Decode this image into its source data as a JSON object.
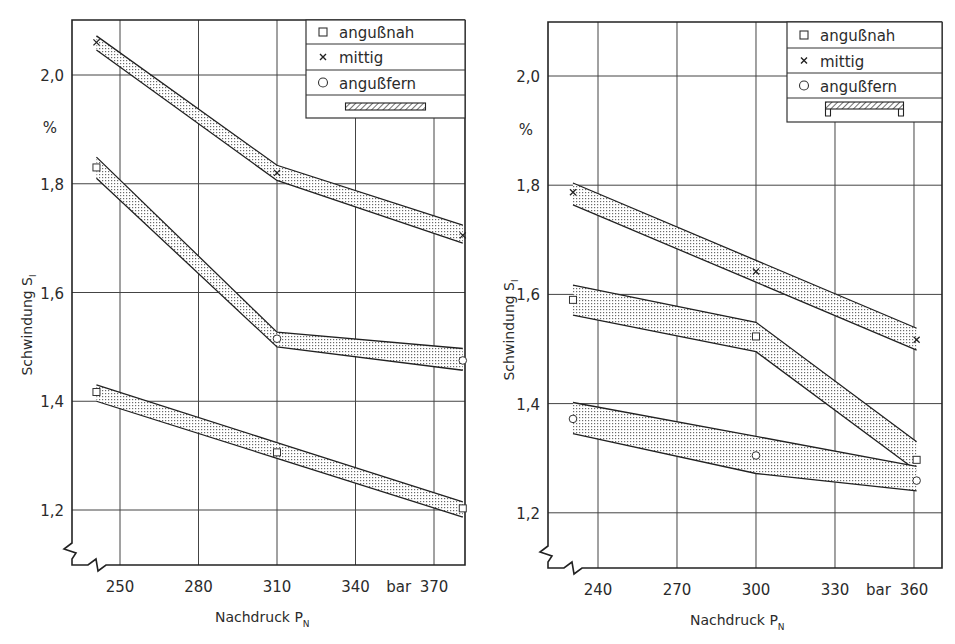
{
  "chart_data": [
    {
      "type": "line",
      "title": "",
      "xlabel": "Nachdruck P_N",
      "xlabel_main": "Nachdruck P",
      "xlabel_sub": "N",
      "ylabel": "Schwindung S_l",
      "ylabel_main": "Schwindung S",
      "ylabel_sub": "l",
      "y_unit": "%",
      "x_unit": "bar",
      "xlim": [
        241,
        381
      ],
      "ylim": [
        1.15,
        2.1
      ],
      "x_ticks": [
        250,
        280,
        310,
        340,
        370
      ],
      "x_tick_labels": [
        "250",
        "280",
        "310",
        "340",
        "370"
      ],
      "y_ticks": [
        1.2,
        1.4,
        1.6,
        1.8,
        2.0
      ],
      "y_tick_labels": [
        "1,2",
        "1,4",
        "1,6",
        "1,8",
        "2,0"
      ],
      "grid": true,
      "legend_position": "upper right",
      "legend": [
        {
          "marker": "square",
          "label": "angußnah"
        },
        {
          "marker": "x",
          "label": "mittig"
        },
        {
          "marker": "circle",
          "label": "angußfern"
        },
        {
          "marker": "part-flat-bar",
          "label": ""
        }
      ],
      "x": [
        241,
        310,
        381
      ],
      "series": [
        {
          "name": "mittig",
          "marker": "x",
          "values": [
            2.06,
            1.82,
            1.705
          ],
          "band_upper": [
            2.072,
            1.834,
            1.724
          ],
          "band_lower": [
            2.046,
            1.806,
            1.691
          ]
        },
        {
          "name": "angußfern",
          "marker": "circle",
          "marker_first": "square",
          "values": [
            1.83,
            1.515,
            1.475
          ],
          "band_upper": [
            1.849,
            1.527,
            1.497
          ],
          "band_lower": [
            1.81,
            1.5,
            1.457
          ]
        },
        {
          "name": "angußnah",
          "marker": "square",
          "values": [
            1.417,
            1.306,
            1.203
          ],
          "band_upper": [
            1.43,
            null,
            1.215
          ],
          "band_lower": [
            1.4,
            null,
            1.187
          ]
        }
      ]
    },
    {
      "type": "line",
      "title": "",
      "xlabel": "Nachdruck P_N",
      "xlabel_main": "Nachdruck P",
      "xlabel_sub": "N",
      "ylabel": "Schwindung S_l",
      "ylabel_main": "Schwindung S",
      "ylabel_sub": "l",
      "y_unit": "%",
      "x_unit": "bar",
      "xlim": [
        230.5,
        361
      ],
      "ylim": [
        1.15,
        2.1
      ],
      "x_ticks": [
        240,
        270,
        300,
        330,
        360
      ],
      "x_tick_labels": [
        "240",
        "270",
        "300",
        "330",
        "360"
      ],
      "y_ticks": [
        1.2,
        1.4,
        1.6,
        1.8,
        2.0
      ],
      "y_tick_labels": [
        "1,2",
        "1,4",
        "1,6",
        "1,8",
        "2,0"
      ],
      "grid": true,
      "legend_position": "upper right",
      "legend": [
        {
          "marker": "square",
          "label": "angußnah"
        },
        {
          "marker": "x",
          "label": "mittig"
        },
        {
          "marker": "circle",
          "label": "angußfern"
        },
        {
          "marker": "part-u-profile",
          "label": ""
        }
      ],
      "x": [
        230.5,
        300,
        361
      ],
      "series": [
        {
          "name": "mittig",
          "marker": "x",
          "values": [
            1.787,
            1.642,
            1.517
          ],
          "band_upper": [
            1.804,
            null,
            1.538
          ],
          "band_lower": [
            1.764,
            null,
            1.498
          ]
        },
        {
          "name": "angußnah",
          "marker": "square",
          "values": [
            1.59,
            1.523,
            1.297
          ],
          "band_upper": [
            1.617,
            1.549,
            1.33
          ],
          "band_lower": [
            1.562,
            1.495,
            1.277
          ]
        },
        {
          "name": "angußfern",
          "marker": "circle",
          "values": [
            1.372,
            1.305,
            1.259
          ],
          "band_upper": [
            1.402,
            1.34,
            1.285
          ],
          "band_lower": [
            1.345,
            1.272,
            1.24
          ]
        }
      ]
    }
  ],
  "layout": {
    "charts": [
      {
        "frame": [
          72,
          20,
          465,
          565
        ],
        "x0": 120,
        "xv0": 250,
        "xppu": 2.6167,
        "y0": 75,
        "yv0": 2.0,
        "yppu": 543.75,
        "legend_box": [
          306,
          20,
          465,
          118
        ],
        "legend_rows": [
          20,
          44,
          70,
          95,
          118
        ],
        "ylabel_x": 32,
        "ylabel_y": 325,
        "pct_y": 133,
        "xlabel_y": 622,
        "xlabel_x": 215
      },
      {
        "frame": [
          548,
          22,
          942,
          568
        ],
        "x0": 598,
        "xv0": 240,
        "xppu": 2.6333,
        "y0": 76,
        "yv0": 2.0,
        "yppu": 546,
        "legend_box": [
          787,
          22,
          942,
          122
        ],
        "legend_rows": [
          22,
          48,
          73,
          98,
          122
        ],
        "ylabel_x": 514,
        "ylabel_y": 330,
        "pct_y": 135,
        "xlabel_y": 625,
        "xlabel_x": 690
      }
    ]
  }
}
